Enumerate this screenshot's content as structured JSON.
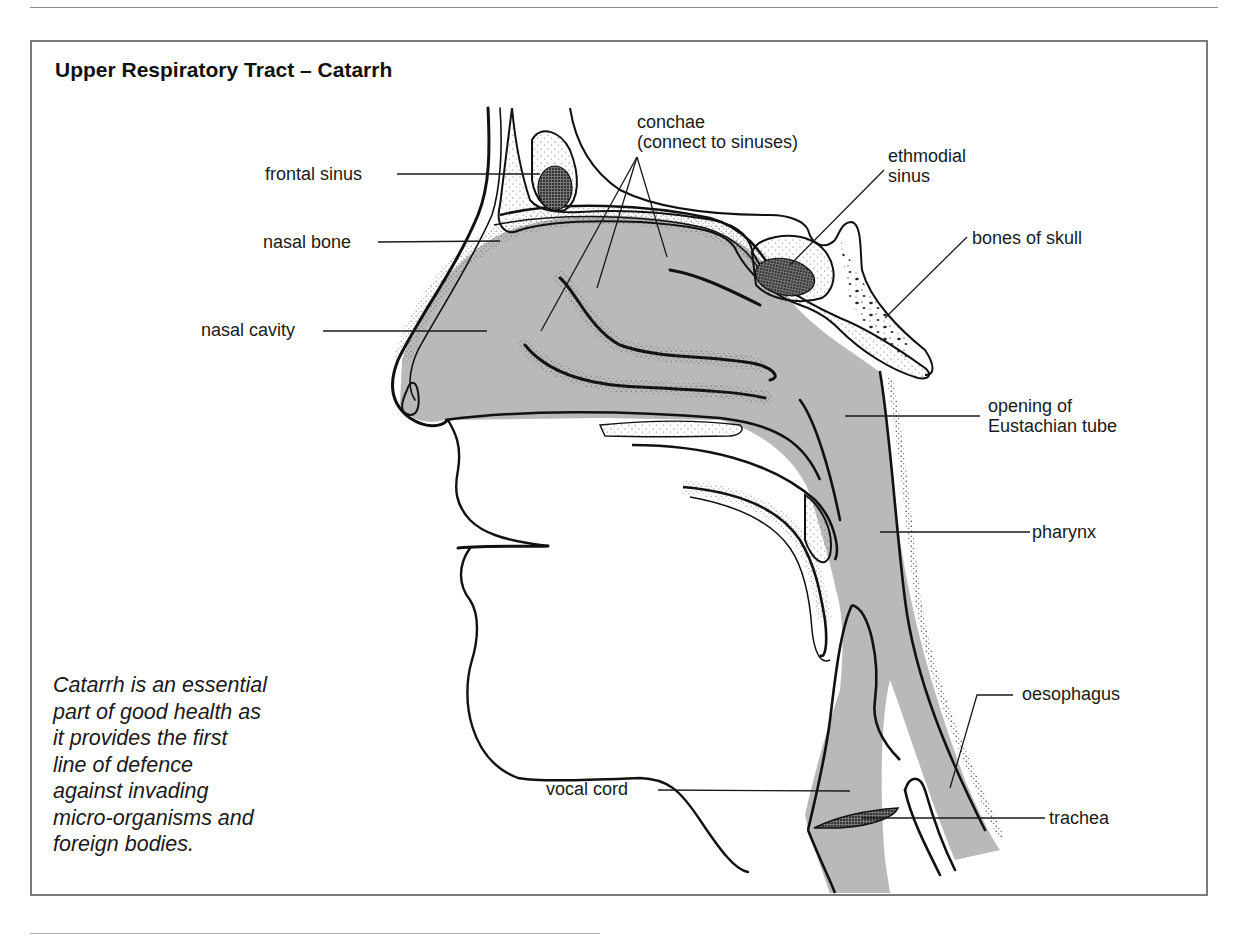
{
  "figure": {
    "title": "Upper Respiratory Tract – Catarrh",
    "caption": "Catarrh is an essential\npart of good health as\nit provides the first\nline of defence\nagainst invading\nmicro-organisms and\nforeign bodies.",
    "colors": {
      "tissue_fill": "#b9b9b9",
      "tissue_dark": "#8c8c8c",
      "outline": "#111111",
      "frame": "#7a7a7a",
      "background": "#ffffff"
    },
    "labels": [
      {
        "id": "frontal-sinus",
        "text": "frontal sinus",
        "side": "left"
      },
      {
        "id": "nasal-bone",
        "text": "nasal bone",
        "side": "left"
      },
      {
        "id": "nasal-cavity",
        "text": "nasal cavity",
        "side": "left"
      },
      {
        "id": "conchae",
        "text": "conchae",
        "side": "top"
      },
      {
        "id": "conchae-note",
        "text": "(connect to sinuses)",
        "side": "top"
      },
      {
        "id": "ethmodial-sinus-1",
        "text": "ethmodial",
        "side": "top-right"
      },
      {
        "id": "ethmodial-sinus-2",
        "text": "sinus",
        "side": "top-right"
      },
      {
        "id": "bones-of-skull",
        "text": "bones of skull",
        "side": "right"
      },
      {
        "id": "eustachian-1",
        "text": "opening of",
        "side": "right"
      },
      {
        "id": "eustachian-2",
        "text": "Eustachian tube",
        "side": "right"
      },
      {
        "id": "pharynx",
        "text": "pharynx",
        "side": "right"
      },
      {
        "id": "oesophagus",
        "text": "oesophagus",
        "side": "right"
      },
      {
        "id": "trachea",
        "text": "trachea",
        "side": "right"
      },
      {
        "id": "vocal-cord",
        "text": "vocal cord",
        "side": "bottom"
      }
    ]
  }
}
